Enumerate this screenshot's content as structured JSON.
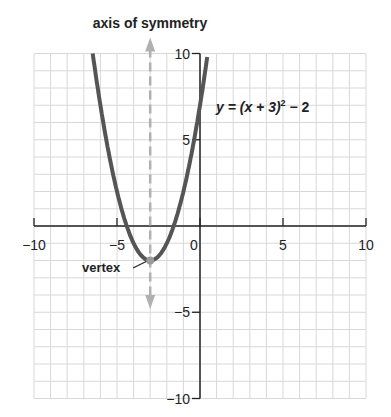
{
  "title": "axis of symmetry",
  "equation": {
    "lhs": "y = (x + 3)",
    "exp": "2",
    "rhs": " − 2"
  },
  "vertex_label": "vertex",
  "x_ticks": [
    {
      "v": -10,
      "label": "−10"
    },
    {
      "v": -5,
      "label": "−5"
    },
    {
      "v": 0,
      "label": "0"
    },
    {
      "v": 5,
      "label": "5"
    },
    {
      "v": 10,
      "label": "10"
    }
  ],
  "y_ticks": [
    {
      "v": 10,
      "label": "10"
    },
    {
      "v": 5,
      "label": "5"
    },
    {
      "v": -5,
      "label": "−5"
    },
    {
      "v": -10,
      "label": "−10"
    }
  ],
  "colors": {
    "curve": "#555555",
    "grid": "#d8d8d8",
    "axis": "#222222",
    "symmetry": "#b0b0b0",
    "vertex": "#9a9a9a"
  },
  "chart_data": {
    "type": "line",
    "xlabel": "",
    "ylabel": "",
    "xlim": [
      -10,
      10
    ],
    "ylim": [
      -10,
      10
    ],
    "grid": true,
    "series": [
      {
        "name": "y = (x + 3)^2 - 2",
        "x": [
          -6.46,
          -6,
          -5,
          -4,
          -3,
          -2,
          -1,
          0,
          0.46
        ],
        "y": [
          10,
          7,
          2,
          -1,
          -2,
          -1,
          2,
          7,
          10
        ]
      }
    ],
    "annotations": [
      {
        "text": "vertex",
        "x": -3,
        "y": -2
      },
      {
        "text": "axis of symmetry",
        "x": -3,
        "type": "dashed vertical line"
      }
    ]
  }
}
